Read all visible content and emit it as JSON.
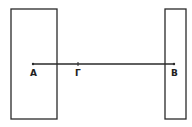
{
  "diagram": {
    "stroke_color": "#2a2a2a",
    "background": "#ffffff",
    "rect_left": {
      "x": 11,
      "y": 9,
      "w": 46,
      "h": 110
    },
    "rect_right": {
      "x": 165,
      "y": 9,
      "w": 21,
      "h": 110
    },
    "segment": {
      "x1": 33,
      "y1": 64,
      "x2": 174,
      "y2": 64
    },
    "points": [
      {
        "label": "A",
        "x": 33,
        "y": 64
      },
      {
        "label": "Γ",
        "x": 78,
        "y": 64
      },
      {
        "label": "B",
        "x": 174,
        "y": 64
      }
    ]
  }
}
